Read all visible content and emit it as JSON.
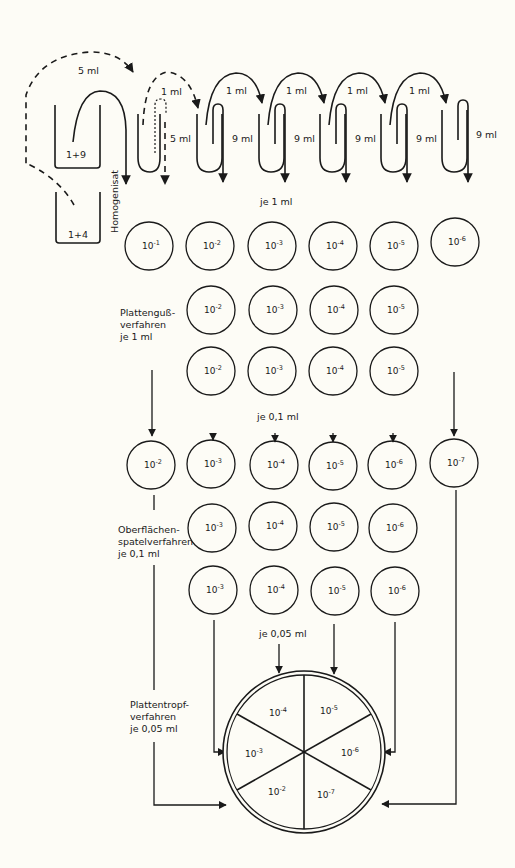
{
  "dilution_series": {
    "transfer_dashed_label": "5 ml",
    "tube_labels": [
      "1+9",
      "1+4"
    ],
    "homogenate_label": "Homogenisat",
    "first_tube_volume": "5 ml",
    "transfer_volumes": [
      "1 ml",
      "1 ml",
      "1 ml",
      "1 ml",
      "1 ml"
    ],
    "diluent_volumes": [
      "9 ml",
      "9 ml",
      "9 ml",
      "9 ml",
      "9 ml"
    ]
  },
  "labels": {
    "je_1ml": "je 1 ml",
    "je_01ml": "je 0,1 ml",
    "je_005ml": "je 0,05 ml",
    "pour_plate": [
      "Plattenguß-",
      "verfahren",
      "je 1 ml"
    ],
    "spread_plate": [
      "Oberflächen-",
      "spatelverfahren",
      "je 0,1 ml"
    ],
    "drop_plate": [
      "Plattentropf-",
      "verfahren",
      "je 0,05 ml"
    ]
  },
  "rows": {
    "row1": [
      "10",
      "10",
      "10",
      "10",
      "10",
      "10"
    ],
    "row1_exp": [
      "-1",
      "-2",
      "-3",
      "-4",
      "-5",
      "-6"
    ],
    "row2_exp": [
      "-2",
      "-3",
      "-4",
      "-5"
    ],
    "row3_exp": [
      "-2",
      "-3",
      "-4",
      "-5"
    ],
    "row4_exp": [
      "-2",
      "-3",
      "-4",
      "-5",
      "-6",
      "-7"
    ],
    "row5_exp": [
      "-3",
      "-4",
      "-5",
      "-6"
    ],
    "row6_exp": [
      "-3",
      "-4",
      "-5",
      "-6"
    ]
  },
  "drop_plate_sectors": {
    "base": "10",
    "top_left": "-4",
    "top_right": "-5",
    "left": "-3",
    "right": "-6",
    "bottom_left": "-2",
    "bottom_right": "-7"
  }
}
